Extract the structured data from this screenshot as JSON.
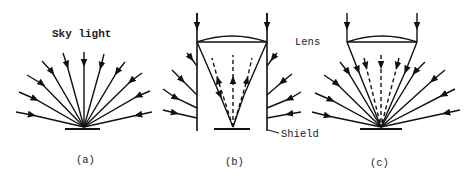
{
  "figure": {
    "labels": {
      "sky_light": "Sky light",
      "lens": "Lens",
      "shield": "Shield",
      "caption_a": "(a)",
      "caption_b": "(b)",
      "caption_c": "(c)"
    },
    "colors": {
      "line": "#111111",
      "background": "#ffffff"
    },
    "panels": [
      {
        "id": "a",
        "description": "Sky light rays converging onto a bare sensor from all directions"
      },
      {
        "id": "b",
        "description": "Lens with cylindrical shield; oblique sky rays blocked by shield, lens focuses vertical rays to point; dashed rays reflected upward"
      },
      {
        "id": "c",
        "description": "Lens without shield; oblique sky rays and lens-focused rays both reach sensor; dashed rays directed downward"
      }
    ]
  }
}
